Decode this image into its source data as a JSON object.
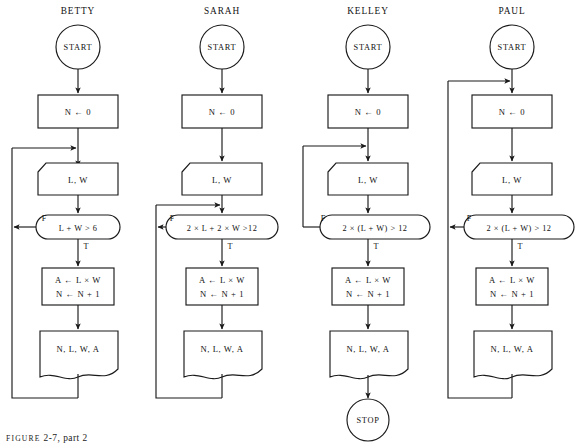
{
  "figure": {
    "caption_prefix": "FIGURE",
    "caption_body": "2-7, part 2"
  },
  "columns": [
    {
      "title": "BETTY",
      "start_label": "START",
      "init_label": "N ← 0",
      "input_label": "L, W",
      "condition_label": "L + W > 6",
      "false_label": "F",
      "true_label": "T",
      "process_line1": "A ← L × W",
      "process_line2": "N ← N + 1",
      "output_label": "N, L, W, A",
      "stop_label": ""
    },
    {
      "title": "SARAH",
      "start_label": "START",
      "init_label": "N ← 0",
      "input_label": "L, W",
      "condition_label": "2 × L + 2 × W >12",
      "false_label": "F",
      "true_label": "T",
      "process_line1": "A ← L × W",
      "process_line2": "N ← N + 1",
      "output_label": "N, L, W, A",
      "stop_label": ""
    },
    {
      "title": "KELLEY",
      "start_label": "START",
      "init_label": "N ← 0",
      "input_label": "L, W",
      "condition_label": "2 × (L + W) > 12",
      "false_label": "F",
      "true_label": "T",
      "process_line1": "A ← L × W",
      "process_line2": "N ← N + 1",
      "output_label": "N, L, W, A",
      "stop_label": "STOP"
    },
    {
      "title": "PAUL",
      "start_label": "START",
      "init_label": "N ← 0",
      "input_label": "L, W",
      "condition_label": "2 × (L + W) > 12",
      "false_label": "F",
      "true_label": "T",
      "process_line1": "A ← L × W",
      "process_line2": "N ← N + 1",
      "output_label": "N, L, W, A",
      "stop_label": ""
    }
  ]
}
